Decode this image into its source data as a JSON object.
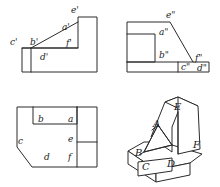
{
  "drawing": {
    "title": "Orthographic projection with isometric pictorial",
    "line_color": "#2b2b2b",
    "background_color": "#ffffff",
    "face_fill": "#ffffff"
  },
  "front_view": {
    "name": "front-view",
    "labels": {
      "a": "a'",
      "b": "b'",
      "c": "c'",
      "d": "d'",
      "e": "e'",
      "f": "f'"
    }
  },
  "side_view": {
    "name": "side-view",
    "labels": {
      "a": "a\"",
      "b": "b\"",
      "c": "c\"",
      "d": "d\"",
      "e": "e\"",
      "f": "f\""
    }
  },
  "top_view": {
    "name": "top-view",
    "labels": {
      "a": "a",
      "b": "b",
      "c": "c",
      "d": "d",
      "e": "e",
      "f": "f"
    }
  },
  "isometric_view": {
    "name": "isometric-view",
    "labels": {
      "a": "A",
      "b": "B",
      "c": "C",
      "d": "D",
      "e": "E",
      "f": "F"
    }
  }
}
